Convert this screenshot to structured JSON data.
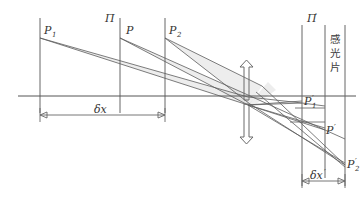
{
  "figure": {
    "labels": {
      "object_p1": "P",
      "object_p1_sub": "1",
      "object_plane_pi": "Π",
      "object_p": "P",
      "object_p2": "P",
      "object_p2_sub": "2",
      "image_plane_pi_prime": "Π",
      "image_plane_pi_prime_mark": "′",
      "image_p1_prime": "P",
      "image_p1_prime_sub": "1",
      "image_p1_prime_mark": "′",
      "image_p_prime": "P",
      "image_p_prime_mark": "′",
      "image_p2_prime": "P",
      "image_p2_prime_sub": "2",
      "image_p2_prime_mark": "′",
      "film_text": "感光片",
      "film_char_1": "感",
      "film_char_2": "光",
      "film_char_3": "片",
      "dim_delta_x": "δx",
      "dim_delta_x_prime": "δx",
      "dim_delta_x_prime_mark": "′"
    },
    "colors": {
      "line": "#5c5c5c",
      "axis": "#555555",
      "beam": "#cfcfcf",
      "text": "#333333",
      "background": "#ffffff"
    },
    "geometry": {
      "optical_axis_y": 96,
      "axis_x_start": 18,
      "axis_x_end": 356,
      "lens_x": 248,
      "object_plane_x": [
        40,
        120,
        165
      ],
      "image_plane_x": [
        302,
        325,
        345
      ],
      "object_point_y": 38,
      "image_points": [
        {
          "name": "P1prime",
          "x": 302,
          "y": 103
        },
        {
          "name": "Pprime",
          "x": 325,
          "y": 130
        },
        {
          "name": "P2prime",
          "x": 345,
          "y": 165
        }
      ],
      "dim_delta_x_y": 115,
      "dim_delta_x_prime_y": 181
    }
  }
}
